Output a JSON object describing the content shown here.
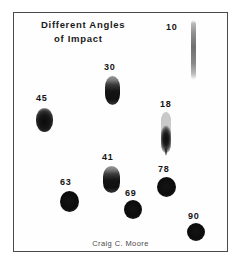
{
  "figure": {
    "title_line_1": "Different Angles",
    "title_line_2": "of Impact",
    "credit": "Craig C. Moore",
    "border_color": "#4a4a4a",
    "background_color": "#ffffff",
    "label_color": "#141414"
  },
  "chart_data": {
    "type": "scatter",
    "title": "Different Angles of Impact",
    "subtitle": "Craig C. Moore",
    "xlabel": "",
    "ylabel": "",
    "annotation": "Bloodstain shape as a function of impact angle: low angles produce long narrow elongated stains with tails, high angles produce circular stains.",
    "categories": [
      "10",
      "30",
      "45",
      "18",
      "41",
      "63",
      "69",
      "78",
      "90"
    ],
    "values": [
      10,
      30,
      45,
      18,
      41,
      63,
      69,
      78,
      90
    ],
    "series": [
      {
        "name": "stain width (px)",
        "values": [
          5,
          15,
          17,
          10,
          17,
          19,
          18,
          19,
          18
        ]
      },
      {
        "name": "stain length (px)",
        "values": [
          60,
          29,
          24,
          41,
          27,
          21,
          19,
          20,
          18
        ]
      }
    ],
    "points": [
      {
        "label": "10",
        "angle_degrees": 10,
        "label_x": 166,
        "label_y": 22,
        "shape_x": 191,
        "shape_y": 20,
        "width": 5,
        "height": 60,
        "tail": false,
        "shape": "long-narrow-streak"
      },
      {
        "label": "30",
        "angle_degrees": 30,
        "label_x": 104,
        "label_y": 62,
        "shape_x": 105,
        "shape_y": 76,
        "width": 15,
        "height": 29,
        "tail": false,
        "shape": "elongated-oval"
      },
      {
        "label": "45",
        "angle_degrees": 45,
        "label_x": 36,
        "label_y": 93,
        "shape_x": 36,
        "shape_y": 108,
        "width": 17,
        "height": 24,
        "tail": false,
        "shape": "oval"
      },
      {
        "label": "18",
        "angle_degrees": 18,
        "label_x": 160,
        "label_y": 99,
        "shape_x": 161,
        "shape_y": 112,
        "width": 10,
        "height": 41,
        "tail": true,
        "shape": "elongated-with-tail"
      },
      {
        "label": "41",
        "angle_degrees": 41,
        "label_x": 102,
        "label_y": 152,
        "shape_x": 103,
        "shape_y": 166,
        "width": 17,
        "height": 27,
        "tail": false,
        "shape": "oval"
      },
      {
        "label": "63",
        "angle_degrees": 63,
        "label_x": 60,
        "label_y": 177,
        "shape_x": 60,
        "shape_y": 191,
        "width": 19,
        "height": 21,
        "tail": false,
        "shape": "near-circular"
      },
      {
        "label": "69",
        "angle_degrees": 69,
        "label_x": 125,
        "label_y": 188,
        "shape_x": 124,
        "shape_y": 200,
        "width": 18,
        "height": 19,
        "tail": false,
        "shape": "near-circular"
      },
      {
        "label": "78",
        "angle_degrees": 78,
        "label_x": 158,
        "label_y": 164,
        "shape_x": 157,
        "shape_y": 177,
        "width": 19,
        "height": 20,
        "tail": false,
        "shape": "circular"
      },
      {
        "label": "90",
        "angle_degrees": 90,
        "label_x": 188,
        "label_y": 211,
        "shape_x": 187,
        "shape_y": 223,
        "width": 18,
        "height": 18,
        "tail": false,
        "shape": "circular"
      }
    ]
  }
}
